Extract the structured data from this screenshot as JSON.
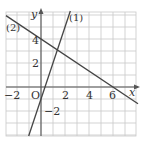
{
  "diagram": {
    "type": "coordinate-plane-lines",
    "axes": {
      "x_label": "x",
      "y_label": "y",
      "origin_label": "O",
      "x_range": [
        -3,
        8
      ],
      "y_range": [
        -4,
        6
      ],
      "x_tick_labels": [
        "−2",
        "2",
        "4",
        "6"
      ],
      "y_tick_labels": [
        "4",
        "2",
        "−2"
      ],
      "grid": true,
      "grid_unit": 1
    },
    "lines": [
      {
        "label": "(1)",
        "equation": "y = 3x - 1",
        "slope": 3,
        "intercept": -1
      },
      {
        "label": "(2)",
        "equation": "y = -2/3 x + 4",
        "slope": -0.6667,
        "intercept": 4
      }
    ],
    "colors": {
      "grid": "#c8c8c8",
      "axes": "#555555",
      "lines": "#444444",
      "text": "#333333"
    }
  }
}
